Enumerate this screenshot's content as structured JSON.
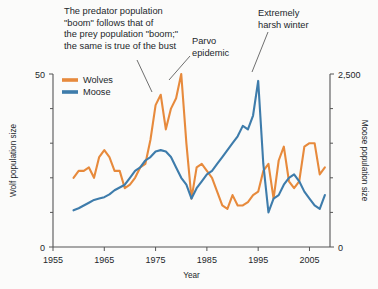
{
  "chart_data": {
    "type": "line",
    "title": "",
    "xlabel": "Year",
    "ylabel_left": "Wolf population size",
    "ylabel_right": "Moose population size",
    "xlim": [
      1955,
      2009
    ],
    "xticks": [
      1955,
      1965,
      1975,
      1985,
      1995,
      2005
    ],
    "xticklabels": [
      "1955",
      "1965",
      "1975",
      "1985",
      "1995",
      "2005"
    ],
    "ylim_left": [
      0,
      50
    ],
    "yticks_left": [
      0,
      50
    ],
    "yticklabels_left": [
      "0",
      "50"
    ],
    "yminor_left": [
      10,
      20,
      30,
      40
    ],
    "ylim_right": [
      0,
      2500
    ],
    "yticks_right": [
      0,
      2500
    ],
    "yticklabels_right": [
      "0",
      "2,500"
    ],
    "yminor_right": [
      500,
      1000,
      1500,
      2000
    ],
    "grid": false,
    "legend_position": "upper-left",
    "series": [
      {
        "name": "Wolves",
        "axis": "left",
        "color": "#E78A3C",
        "x": [
          1959,
          1960,
          1961,
          1962,
          1963,
          1964,
          1965,
          1966,
          1967,
          1968,
          1969,
          1970,
          1971,
          1972,
          1973,
          1974,
          1975,
          1976,
          1977,
          1978,
          1979,
          1980,
          1981,
          1982,
          1983,
          1984,
          1985,
          1986,
          1987,
          1988,
          1989,
          1990,
          1991,
          1992,
          1993,
          1994,
          1995,
          1996,
          1997,
          1998,
          1999,
          2000,
          2001,
          2002,
          2003,
          2004,
          2005,
          2006,
          2007,
          2008
        ],
        "values": [
          20,
          22,
          22,
          23,
          20,
          26,
          28,
          26,
          22,
          22,
          17,
          18,
          20,
          23,
          24,
          31,
          41,
          44,
          34,
          40,
          43,
          50,
          30,
          14,
          23,
          24,
          22,
          20,
          16,
          12,
          11,
          15,
          12,
          12,
          13,
          15,
          16,
          22,
          24,
          14,
          25,
          29,
          19,
          17,
          19,
          29,
          30,
          30,
          21,
          23
        ]
      },
      {
        "name": "Moose",
        "axis": "right",
        "color": "#3E7CAB",
        "x": [
          1959,
          1960,
          1961,
          1962,
          1963,
          1964,
          1965,
          1966,
          1967,
          1968,
          1969,
          1970,
          1971,
          1972,
          1973,
          1974,
          1975,
          1976,
          1977,
          1978,
          1979,
          1980,
          1981,
          1982,
          1983,
          1984,
          1985,
          1986,
          1987,
          1988,
          1989,
          1990,
          1991,
          1992,
          1993,
          1994,
          1995,
          1996,
          1997,
          1998,
          1999,
          2000,
          2001,
          2002,
          2003,
          2004,
          2005,
          2006,
          2007,
          2008
        ],
        "values": [
          530,
          560,
          600,
          640,
          680,
          700,
          720,
          760,
          820,
          860,
          900,
          1000,
          1100,
          1150,
          1250,
          1300,
          1380,
          1400,
          1380,
          1300,
          1150,
          1000,
          900,
          700,
          850,
          950,
          1050,
          1100,
          1200,
          1300,
          1400,
          1500,
          1600,
          1750,
          1700,
          1900,
          2400,
          1200,
          500,
          700,
          750,
          900,
          1000,
          1050,
          950,
          800,
          700,
          600,
          550,
          750
        ]
      }
    ],
    "annotations": [
      {
        "id": "boom-bust",
        "text_lines": [
          "The predator population",
          "\"boom\" follows that of",
          "the prey population \"boom;\"",
          "the same is true of the bust"
        ]
      },
      {
        "id": "parvo",
        "text_lines": [
          "Parvo",
          "epidemic"
        ]
      },
      {
        "id": "harsh-winter",
        "text_lines": [
          "Extremely",
          "harsh winter"
        ]
      }
    ]
  },
  "colors": {
    "wolves": "#E78A3C",
    "moose": "#3E7CAB",
    "axis": "#555555",
    "text": "#23272B",
    "background": "#FBFBFA"
  }
}
